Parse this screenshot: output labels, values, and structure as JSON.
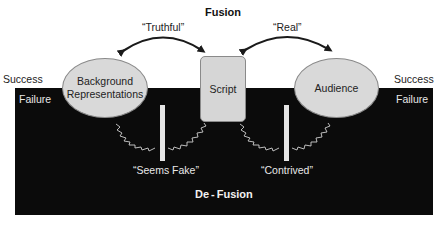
{
  "diagram": {
    "top_title": "Fusion",
    "bottom_title": "De-Fusion",
    "zones": {
      "left_success": "Success",
      "left_failure": "Failure",
      "right_success": "Success",
      "right_failure": "Failure"
    },
    "nodes": {
      "background": "Background Representations",
      "background_line1": "Background",
      "background_line2": "Representations",
      "script": "Script",
      "audience": "Audience"
    },
    "fusion_links": {
      "left": "“Truthful”",
      "right": "“Real”"
    },
    "defusion_links": {
      "left": "“Seems Fake”",
      "right": "“Contrived”"
    },
    "colors": {
      "failure_background": "#0b0b0b",
      "node_fill": "#d9d9d9",
      "arrow": "#1a1a1a",
      "zigzag": "#d0d0d0"
    }
  }
}
